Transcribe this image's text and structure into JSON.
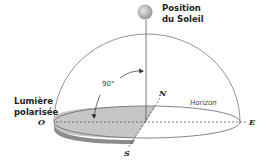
{
  "diagram": {
    "sun_label_line1": "Position",
    "sun_label_line2": "du Soleil",
    "polarized_label_line1": "Lumière",
    "polarized_label_line2": "polarisée",
    "angle_label": "90°",
    "horizon_label": "Horizon",
    "cardinal": {
      "north": "N",
      "south": "S",
      "east": "E",
      "west": "O"
    },
    "colors": {
      "sun_fill": "#b8b8b8",
      "band_fill": "#c9c9c9",
      "band_dark": "#8a8a8a",
      "line": "#555555"
    }
  }
}
